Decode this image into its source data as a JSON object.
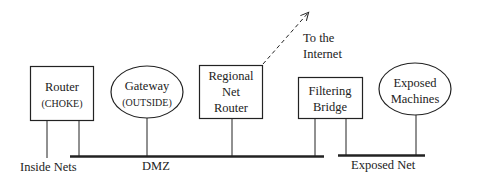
{
  "diagram": {
    "title": "",
    "colors": {
      "stroke": "#222222",
      "background": "#ffffff"
    },
    "nodes": [
      {
        "id": "router",
        "shape": "rect",
        "lines": [
          "Router",
          "(CHOKE)"
        ]
      },
      {
        "id": "gateway",
        "shape": "ellipse",
        "lines": [
          "Gateway",
          "(OUTSIDE)"
        ]
      },
      {
        "id": "regional",
        "shape": "rect",
        "lines": [
          "Regional",
          "Net",
          "Router"
        ]
      },
      {
        "id": "bridge",
        "shape": "rect",
        "lines": [
          "Filtering",
          "Bridge"
        ]
      },
      {
        "id": "exposed",
        "shape": "ellipse",
        "lines": [
          "Exposed",
          "Machines"
        ]
      }
    ],
    "networks": {
      "inside": "Inside Nets",
      "dmz": "DMZ",
      "exposed": "Exposed Net"
    },
    "internet": {
      "lines": [
        "To the",
        "Internet"
      ],
      "style": "dashed-arrow"
    },
    "edges": [
      {
        "from": "router",
        "to": "inside"
      },
      {
        "from": "router",
        "to": "dmz"
      },
      {
        "from": "gateway",
        "to": "dmz"
      },
      {
        "from": "regional",
        "to": "dmz"
      },
      {
        "from": "regional",
        "to": "internet"
      },
      {
        "from": "bridge",
        "to": "dmz"
      },
      {
        "from": "bridge",
        "to": "exposed"
      },
      {
        "from": "exposed",
        "to": "exposed"
      }
    ]
  }
}
